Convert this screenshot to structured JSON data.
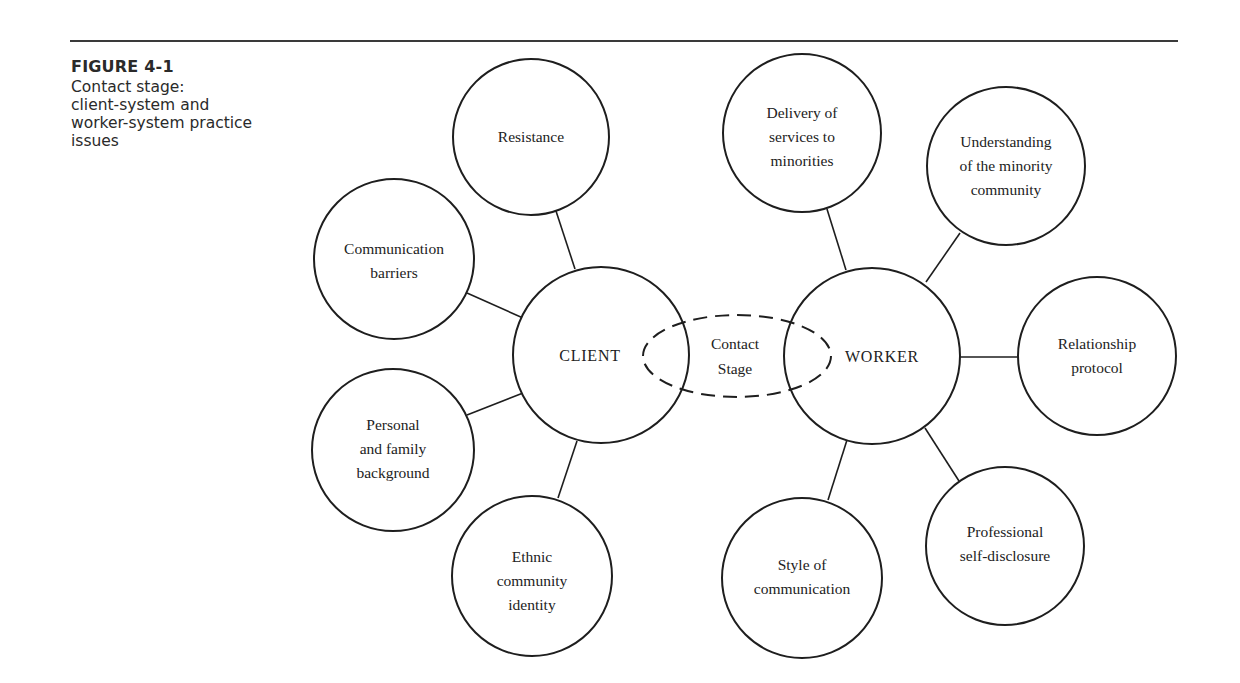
{
  "figure": {
    "label": "FIGURE 4-1",
    "caption": "Contact stage:\nclient-system and\nworker-system practice\nissues"
  },
  "diagram": {
    "center": {
      "label_line1": "Contact",
      "label_line2": "Stage"
    },
    "client": {
      "label": "CLIENT",
      "issues": [
        {
          "lines": [
            "Resistance"
          ]
        },
        {
          "lines": [
            "Communication",
            "barriers"
          ]
        },
        {
          "lines": [
            "Personal",
            "and family",
            "background"
          ]
        },
        {
          "lines": [
            "Ethnic",
            "community",
            "identity"
          ]
        }
      ]
    },
    "worker": {
      "label": "WORKER",
      "issues": [
        {
          "lines": [
            "Delivery of",
            "services to",
            "minorities"
          ]
        },
        {
          "lines": [
            "Understanding",
            "of the minority",
            "community"
          ]
        },
        {
          "lines": [
            "Relationship",
            "protocol"
          ]
        },
        {
          "lines": [
            "Professional",
            "self-disclosure"
          ]
        },
        {
          "lines": [
            "Style of",
            "communication"
          ]
        }
      ]
    }
  }
}
